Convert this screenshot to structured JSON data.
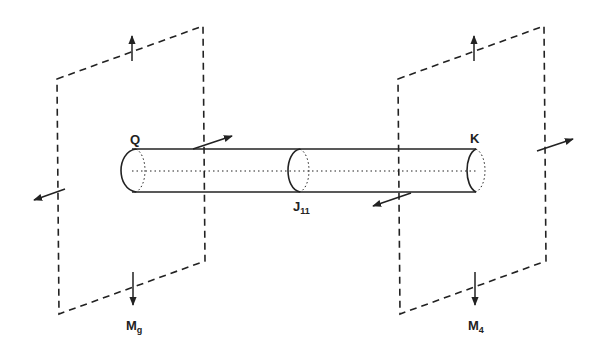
{
  "diagram": {
    "colors": {
      "ink": "#222222",
      "background": "#ffffff"
    },
    "labels": {
      "left_end": "Q",
      "right_end": "K",
      "junction": "J",
      "junction_sub": "11",
      "left_plane": "M",
      "left_plane_sub": "g",
      "right_plane": "M",
      "right_plane_sub": "4"
    },
    "planes": [
      {
        "id": "left",
        "label": "M_g"
      },
      {
        "id": "right",
        "label": "M_4"
      }
    ],
    "cylinder": {
      "left_label": "Q",
      "right_label": "K",
      "junction_label": "J_11"
    }
  }
}
